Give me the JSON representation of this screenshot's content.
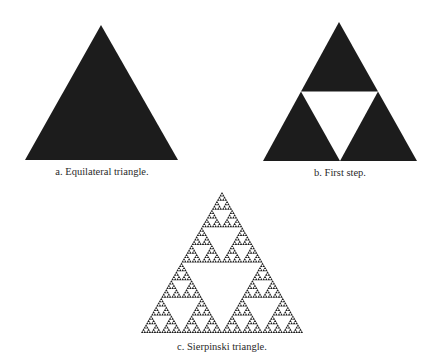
{
  "colors": {
    "background": "#ffffff",
    "fill": "#1c1c1c",
    "hole": "#ffffff"
  },
  "figures": [
    {
      "id": "a",
      "caption": "a. Equilateral triangle.",
      "kind": "solid",
      "apex": [
        101,
        25
      ],
      "base_left": [
        25,
        160
      ],
      "base_right": [
        178,
        160
      ],
      "caption_pos": [
        102,
        166
      ]
    },
    {
      "id": "b",
      "caption": "b. First step.",
      "kind": "sierpinski",
      "depth": 1,
      "apex": [
        339,
        22
      ],
      "base_left": [
        263,
        161
      ],
      "base_right": [
        417,
        161
      ],
      "caption_pos": [
        340,
        167
      ]
    },
    {
      "id": "c",
      "caption": "c. Sierpinski triangle.",
      "kind": "sierpinski",
      "depth": 6,
      "apex": [
        222,
        192
      ],
      "base_left": [
        141,
        333
      ],
      "base_right": [
        303,
        333
      ],
      "caption_pos": [
        222,
        341
      ]
    }
  ]
}
